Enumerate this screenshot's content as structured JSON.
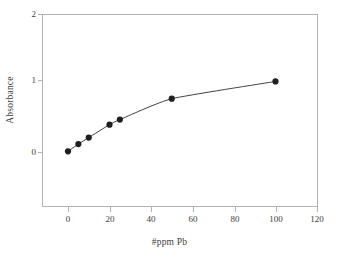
{
  "chart_data": {
    "type": "line",
    "title": "",
    "xlabel": "#ppm Pb",
    "ylabel": "Absorbance",
    "xlim": [
      0,
      120
    ],
    "ylim": [
      0,
      2
    ],
    "xticks": [
      "0",
      "20",
      "40",
      "60",
      "80",
      "100",
      "120"
    ],
    "yticks": [
      "0",
      "1",
      "2"
    ],
    "grid": false,
    "legend": "none",
    "marker": "filled-circle",
    "series": [
      {
        "name": "Absorbance vs #ppm Pb",
        "x": [
          0,
          5,
          10,
          20,
          25,
          50,
          100
        ],
        "values": [
          0.01,
          0.11,
          0.2,
          0.38,
          0.45,
          0.74,
          0.98
        ]
      }
    ]
  },
  "axes": {
    "x_title": "#ppm Pb",
    "y_title": "Absorbance",
    "x_tick_labels": [
      "0",
      "20",
      "40",
      "60",
      "80",
      "100",
      "120"
    ],
    "y_tick_labels": [
      "0",
      "1",
      "2"
    ]
  },
  "colors": {
    "frame": "#b3b3b3",
    "data_line": "#2c2c2c",
    "marker": "#1f1f1f",
    "text": "#3d3d3d",
    "background": "#ffffff"
  }
}
